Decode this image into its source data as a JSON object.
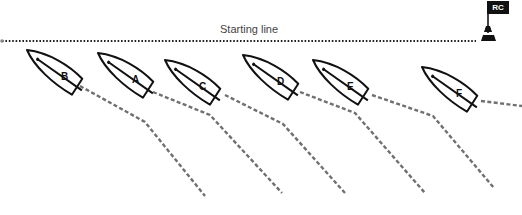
{
  "diagram": {
    "starting_line": {
      "label": "Starting line",
      "style": "dotted",
      "y": 41,
      "x_start": 2,
      "x_end": 476
    },
    "committee_boat": {
      "label": "RC",
      "flag_color": "#111111"
    },
    "colors": {
      "hull": "#111111",
      "wake": "#707070",
      "text": "#444444"
    },
    "boats": [
      {
        "letter": "B",
        "x": 27,
        "y": 50,
        "wake": [
          [
            80,
            86
          ],
          [
            145,
            122
          ],
          [
            205,
            196
          ]
        ]
      },
      {
        "letter": "A",
        "x": 98,
        "y": 53,
        "wake": [
          [
            153,
            92
          ],
          [
            210,
            115
          ],
          [
            282,
            193
          ]
        ]
      },
      {
        "letter": "C",
        "x": 165,
        "y": 60,
        "wake": [
          [
            225,
            95
          ],
          [
            283,
            124
          ],
          [
            345,
            193
          ]
        ]
      },
      {
        "letter": "D",
        "x": 243,
        "y": 55,
        "wake": [
          [
            300,
            92
          ],
          [
            355,
            113
          ],
          [
            425,
            193
          ]
        ]
      },
      {
        "letter": "E",
        "x": 313,
        "y": 60,
        "wake": [
          [
            372,
            95
          ],
          [
            433,
            116
          ],
          [
            494,
            188
          ]
        ]
      },
      {
        "letter": "F",
        "x": 422,
        "y": 67,
        "wake": [
          [
            481,
            101
          ],
          [
            522,
            106
          ]
        ]
      }
    ]
  }
}
